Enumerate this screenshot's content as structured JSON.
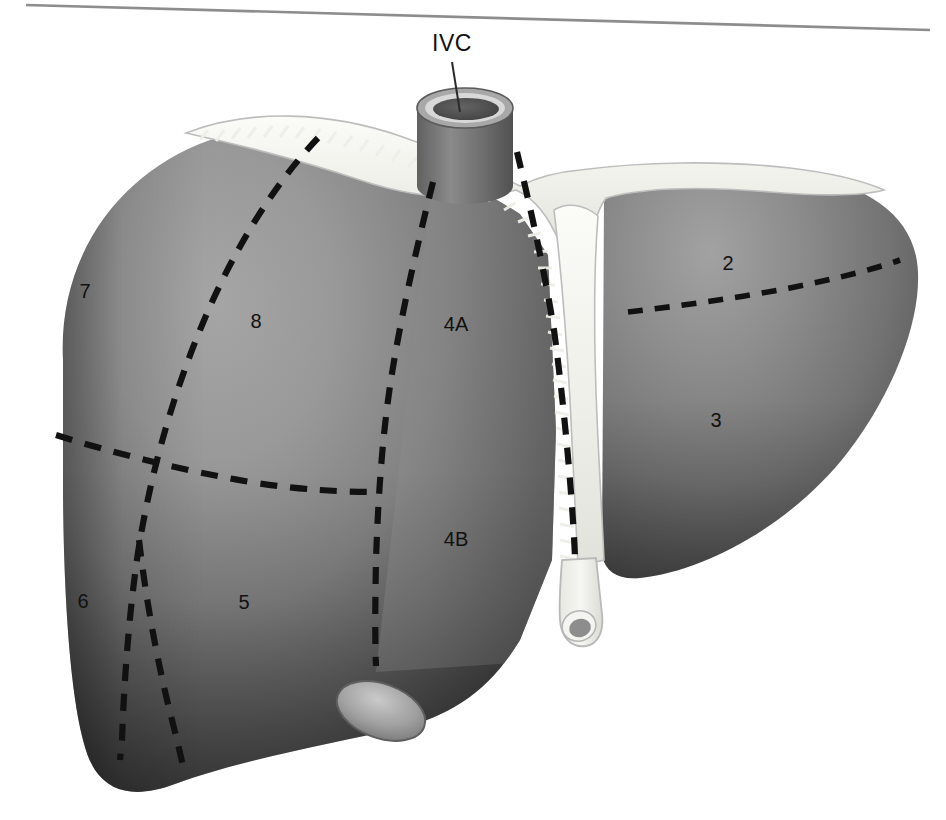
{
  "figure": {
    "top_rule": true
  },
  "labels": {
    "ivc": "IVC",
    "segment_2": "2",
    "segment_3": "3",
    "segment_4a": "4A",
    "segment_4b": "4B",
    "segment_5": "5",
    "segment_6": "6",
    "segment_7": "7",
    "segment_8": "8"
  },
  "anatomy": {
    "ivc_name": "inferior-vena-cava",
    "falciform_name": "falciform-ligament",
    "coronary_name": "coronary-ligament",
    "ligamentum_teres_name": "ligamentum-teres",
    "gallbladder_name": "gallbladder-fundus",
    "right_lobe_name": "right-lobe",
    "left_lobe_name": "left-lobe"
  },
  "colors": {
    "background": "#ffffff",
    "liver_light": "#9c9c9c",
    "liver_mid": "#7e7e7e",
    "liver_dark": "#4d4d4d",
    "liver_darkest": "#3a3a3a",
    "ligament_pale": "#f2f2ee",
    "ligament_outline": "#b9b9b9",
    "dash_line": "#111111",
    "label_text": "#111111",
    "rule": "#8d8d8d",
    "ivc_wall": "#6e6e6e",
    "ivc_rim": "#cfcfcf",
    "ivc_lumen": "#555555",
    "gallbladder": "#8f8f8f"
  },
  "segment_positions": {
    "segment_2": {
      "x": 728,
      "y": 265
    },
    "segment_3": {
      "x": 716,
      "y": 422
    },
    "segment_4a": {
      "x": 456,
      "y": 326
    },
    "segment_4b": {
      "x": 456,
      "y": 541
    },
    "segment_5": {
      "x": 244,
      "y": 604
    },
    "segment_6": {
      "x": 83,
      "y": 603
    },
    "segment_7": {
      "x": 85,
      "y": 293
    },
    "segment_8": {
      "x": 256,
      "y": 323
    },
    "ivc": {
      "x": 452,
      "y": 45
    }
  }
}
